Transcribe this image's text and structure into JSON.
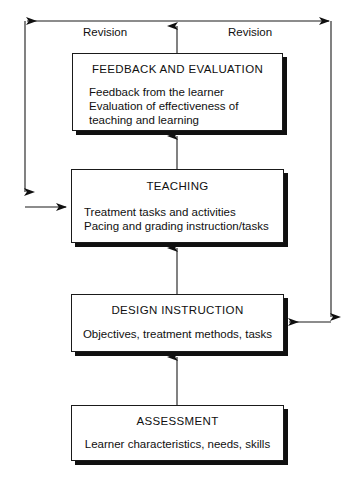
{
  "diagram": {
    "type": "flowchart",
    "orientation": "bottom-to-top",
    "nodes": [
      {
        "id": "feedback-and-evaluation",
        "title": "FEEDBACK AND EVALUATION",
        "body": "Feedback from the learner\nEvaluation of effectiveness of\nteaching and learning"
      },
      {
        "id": "teaching",
        "title": "TEACHING",
        "body": "Treatment tasks and activities\nPacing and grading instruction/tasks"
      },
      {
        "id": "design-instruction",
        "title": "DESIGN INSTRUCTION",
        "body": "Objectives, treatment methods, tasks"
      },
      {
        "id": "assessment",
        "title": "ASSESSMENT",
        "body": "Learner characteristics, needs, skills"
      }
    ],
    "loop_labels": {
      "left": "Revision",
      "right": "Revision"
    },
    "colors": {
      "stroke": "#1a1a1a",
      "shadow": "#101010",
      "fill": "#ffffff",
      "text": "#101010"
    }
  }
}
